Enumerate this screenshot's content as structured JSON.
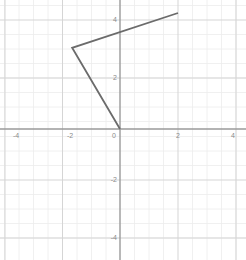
{
  "chart_data": {
    "type": "line",
    "title": "",
    "xlabel": "",
    "ylabel": "",
    "xlim": [
      -4.6,
      4.6
    ],
    "ylim": [
      -4.6,
      4.6
    ],
    "grid": true,
    "grid_major_step": 2,
    "grid_minor_step": 0.5,
    "legend": "none",
    "x_ticks": [
      -4,
      -2,
      0,
      2,
      4
    ],
    "y_ticks": [
      -4,
      -2,
      0,
      2,
      4
    ],
    "x_tick_labels": [
      "-4",
      "-2",
      "0",
      "2",
      "4"
    ],
    "y_tick_labels": [
      "-4",
      "-2",
      "0",
      "2",
      "4"
    ],
    "series": [
      {
        "name": "polyline",
        "points": [
          {
            "x": 2,
            "y": 4
          },
          {
            "x": -1.65,
            "y": 2.8
          },
          {
            "x": 0,
            "y": 0
          }
        ],
        "color": "#6b6b6b",
        "width": 1.8
      }
    ]
  },
  "axes": {
    "axis_color": "#9a9a9a",
    "major_grid_color": "#d8d8d8",
    "minor_grid_color": "#ececec",
    "label_color": "#8a8a8a",
    "background": "#ffffff"
  },
  "labels": {
    "x_neg4": "-4",
    "x_neg2": "-2",
    "x_zero": "0",
    "x_pos2": "2",
    "x_pos4": "4",
    "y_neg4": "-4",
    "y_neg2": "-2",
    "y_pos2": "2",
    "y_pos4": "4"
  }
}
